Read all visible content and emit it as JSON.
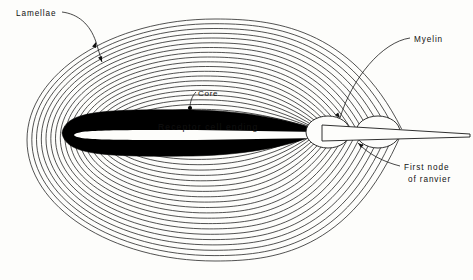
{
  "figure": {
    "background_color": "#fdfdfb",
    "ink_color": "#1a1a1a",
    "core_fill_color": "#000000"
  },
  "labels": {
    "lamellae": "Lamellae",
    "core": "Core",
    "receptor_cell_ending": "Receptor cell ending",
    "myelin": "Myelin",
    "first_node_line1": "First node",
    "first_node_line2": "of ranvier"
  },
  "structure": {
    "lamellae_count": 21,
    "outer_ellipse": {
      "cx": 215,
      "cy": 140,
      "rx": 188,
      "ry": 121
    },
    "inner_ellipse": {
      "cx": 196,
      "cy": 134,
      "rx": 74,
      "ry": 20
    },
    "core": {
      "x_left": 62,
      "x_right": 322,
      "cy": 133,
      "half_height": 22
    },
    "core_band": {
      "x_left": 74,
      "x_right": 318,
      "cy": 135,
      "half_height": 5
    },
    "node_bulges": [
      {
        "cx": 328,
        "cy": 132,
        "rx": 22,
        "ry": 16
      },
      {
        "cx": 378,
        "cy": 132,
        "rx": 22,
        "ry": 16
      }
    ],
    "axon_tip_x": 470,
    "convergence_point": {
      "x": 352,
      "y": 131
    }
  },
  "leaders": {
    "lamellae_arrow": {
      "x1": 96,
      "y1": 42,
      "x2": 102,
      "y2": 62
    },
    "core_dot": {
      "x": 190,
      "y": 108
    },
    "myelin_target": {
      "x": 340,
      "y": 118
    },
    "node_target": {
      "x": 358,
      "y": 143
    }
  }
}
